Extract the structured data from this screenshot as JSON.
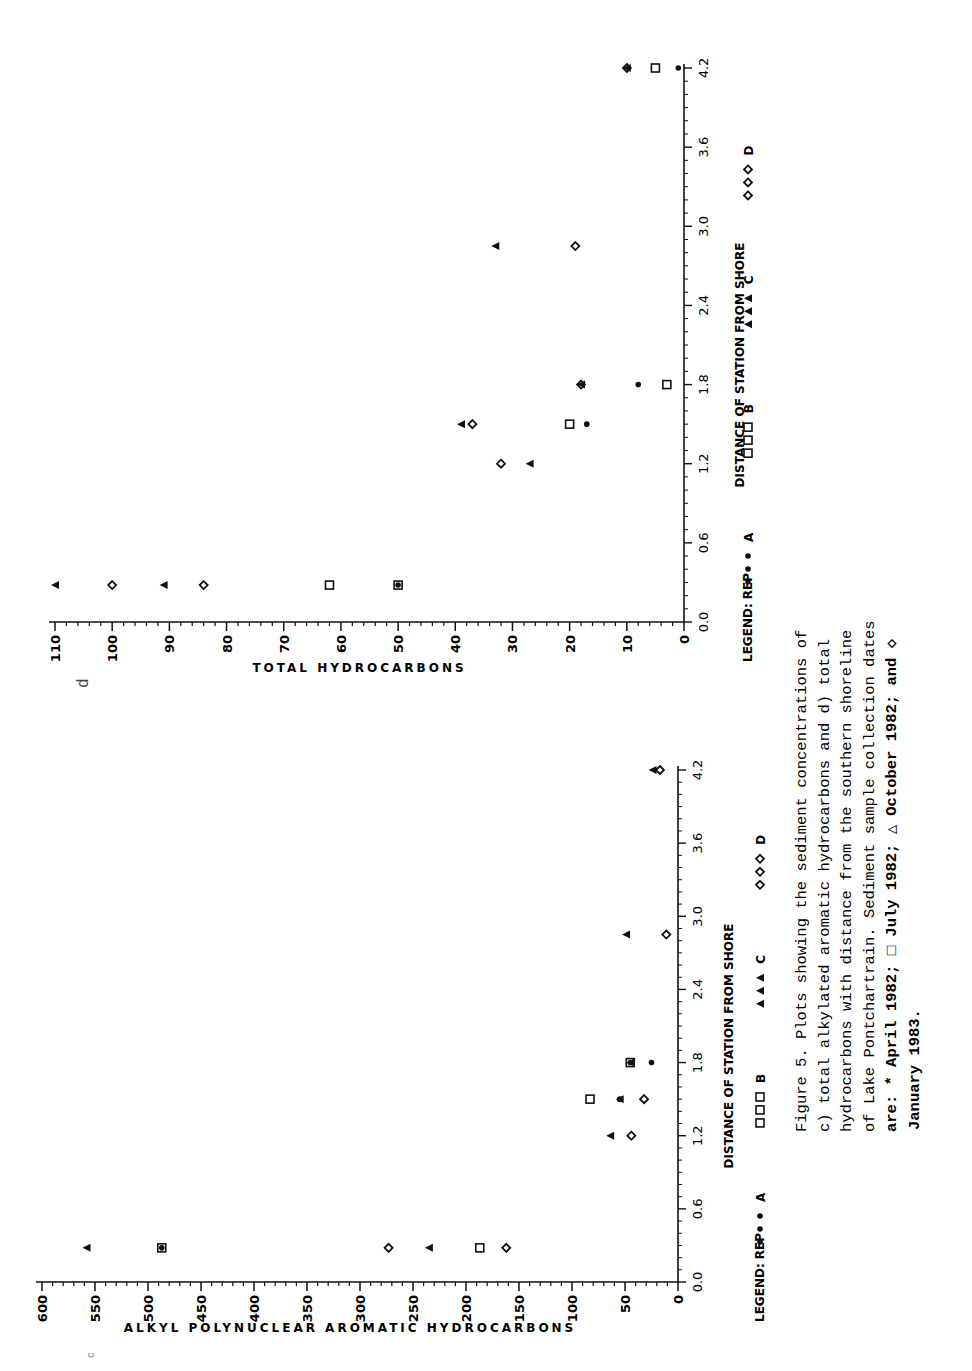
{
  "figure": {
    "caption_lines": [
      "Figure 5.  Plots showing the sediment concentrations of",
      "c) total alkylated aromatic hydrocarbons and d) total",
      "hydrocarbons with distance from the southern shoreline",
      "of Lake Pontchartrain.  Sediment sample collection dates",
      "are: * April 1982; □ July 1982; △ October 1982; and ◇",
      "January 1983."
    ],
    "panel_label_d": "d",
    "panel_label_c": "c"
  },
  "legend": {
    "title": "LEGEND: REP",
    "items": [
      {
        "marker": "star",
        "label": "A"
      },
      {
        "marker": "square",
        "label": "B"
      },
      {
        "marker": "triangle",
        "label": "C"
      },
      {
        "marker": "diamond",
        "label": "D"
      }
    ]
  },
  "chart_data": [
    {
      "panel": "d",
      "type": "scatter",
      "title": "",
      "xlabel": "DISTANCE OF STATION FROM SHORE",
      "ylabel": "TOTAL HYDROCARBONS",
      "x_ticks": [
        "0.0",
        "0.6",
        "1.2",
        "1.8",
        "2.4",
        "3.0",
        "3.6",
        "4.2"
      ],
      "y_ticks": [
        "0",
        "10",
        "20",
        "30",
        "40",
        "50",
        "60",
        "70",
        "80",
        "90",
        "100",
        "110"
      ],
      "xlim": [
        0,
        4.2
      ],
      "ylim": [
        0,
        110
      ],
      "grid": false,
      "legend_position": "below",
      "series": [
        {
          "name": "A (April 1982)",
          "marker": "star",
          "points": [
            [
              0.28,
              50
            ],
            [
              1.5,
              17
            ],
            [
              1.8,
              8
            ],
            [
              4.2,
              1
            ]
          ]
        },
        {
          "name": "B (July 1982)",
          "marker": "square",
          "points": [
            [
              0.28,
              62
            ],
            [
              0.28,
              50
            ],
            [
              1.5,
              20
            ],
            [
              1.8,
              3
            ],
            [
              4.2,
              5
            ]
          ]
        },
        {
          "name": "C (October 1982)",
          "marker": "triangle",
          "points": [
            [
              0.28,
              110
            ],
            [
              0.28,
              91
            ],
            [
              1.2,
              27
            ],
            [
              1.5,
              39
            ],
            [
              1.8,
              18
            ],
            [
              2.85,
              33
            ],
            [
              4.2,
              10
            ]
          ]
        },
        {
          "name": "D (January 1983)",
          "marker": "diamond",
          "points": [
            [
              0.28,
              100
            ],
            [
              0.28,
              84
            ],
            [
              1.2,
              32
            ],
            [
              1.5,
              37
            ],
            [
              1.8,
              18
            ],
            [
              2.85,
              19
            ],
            [
              4.2,
              10
            ]
          ]
        }
      ]
    },
    {
      "panel": "c",
      "type": "scatter",
      "title": "",
      "xlabel": "DISTANCE OF STATION FROM SHORE",
      "ylabel": "ALKYL POLYNUCLEAR AROMATIC HYDROCARBONS",
      "x_ticks": [
        "0.0",
        "0.6",
        "1.2",
        "1.8",
        "2.4",
        "3.0",
        "3.6",
        "4.2"
      ],
      "y_ticks": [
        "0",
        "50",
        "100",
        "150",
        "200",
        "250",
        "300",
        "350",
        "400",
        "450",
        "500",
        "550",
        "600"
      ],
      "xlim": [
        0,
        4.2
      ],
      "ylim": [
        0,
        600
      ],
      "grid": false,
      "legend_position": "below",
      "series": [
        {
          "name": "A (April 1982)",
          "marker": "star",
          "points": [
            [
              0.28,
              487
            ],
            [
              1.5,
              55
            ],
            [
              1.8,
              45
            ],
            [
              1.8,
              25
            ]
          ]
        },
        {
          "name": "B (July 1982)",
          "marker": "square",
          "points": [
            [
              0.28,
              487
            ],
            [
              0.28,
              187
            ],
            [
              1.5,
              83
            ],
            [
              1.8,
              45
            ]
          ]
        },
        {
          "name": "C (October 1982)",
          "marker": "triangle",
          "points": [
            [
              0.28,
              558
            ],
            [
              0.28,
              235
            ],
            [
              1.2,
              64
            ],
            [
              1.5,
              55
            ],
            [
              1.8,
              45
            ],
            [
              2.85,
              49
            ],
            [
              4.2,
              24
            ]
          ]
        },
        {
          "name": "D (January 1983)",
          "marker": "diamond",
          "points": [
            [
              0.28,
              273
            ],
            [
              0.28,
              162
            ],
            [
              1.2,
              44
            ],
            [
              1.5,
              32
            ],
            [
              2.85,
              11
            ],
            [
              4.2,
              17
            ]
          ]
        }
      ]
    }
  ]
}
